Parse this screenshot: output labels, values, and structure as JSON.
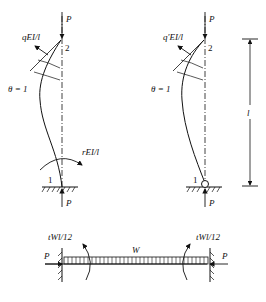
{
  "left_column": {
    "top_load": "P",
    "top_node": "2",
    "top_moment": "qEI/l",
    "rotation": "θ = 1",
    "bottom_moment": "rEI/l",
    "bottom_node": "1",
    "bottom_load": "P",
    "support": "fixed"
  },
  "right_column": {
    "top_load": "P",
    "top_node": "2",
    "top_moment": "q′EI/l",
    "rotation": "θ = 1",
    "bottom_node": "1",
    "bottom_load": "P",
    "support": "pinned"
  },
  "dimension": {
    "label": "l"
  },
  "beam": {
    "load_label": "W",
    "left_moment": "tWl/12",
    "right_moment": "tWl/12",
    "left_axial": "P",
    "right_axial": "P"
  },
  "colors": {
    "ink": "#111111",
    "background": "#ffffff"
  }
}
